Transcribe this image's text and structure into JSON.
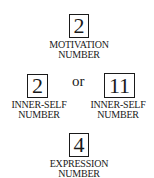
{
  "diagram": {
    "top": {
      "number": "2",
      "label_line1": "MOTIVATION",
      "label_line2": "NUMBER"
    },
    "connector": "or",
    "left": {
      "number": "2",
      "label_line1": "INNER-SELF",
      "label_line2": "NUMBER"
    },
    "right": {
      "number": "11",
      "label_line1": "INNER-SELF",
      "label_line2": "NUMBER"
    },
    "bottom": {
      "number": "4",
      "label_line1": "EXPRESSION",
      "label_line2": "NUMBER"
    }
  }
}
